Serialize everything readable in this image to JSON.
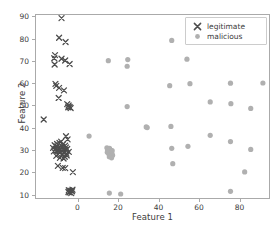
{
  "chart_data": {
    "type": "scatter",
    "title": "",
    "xlabel": "Feature 1",
    "ylabel": "Feature 2",
    "xlim": [
      -21,
      95
    ],
    "ylim": [
      8,
      91
    ],
    "xticks": [
      0,
      20,
      40,
      60,
      80
    ],
    "yticks": [
      10,
      20,
      30,
      40,
      50,
      60,
      70,
      80,
      90
    ],
    "grid": false,
    "legend_position": "upper right",
    "series": [
      {
        "name": "legitimate",
        "marker": "x",
        "color": "#4d4d4d",
        "points": [
          [
            -8.4,
            89.6
          ],
          [
            -9.6,
            80.8
          ],
          [
            -6.4,
            78.9
          ],
          [
            -11.6,
            73.0
          ],
          [
            -12.0,
            71.6
          ],
          [
            -8.4,
            71.4
          ],
          [
            -6.6,
            70.6
          ],
          [
            -11.8,
            68.8
          ],
          [
            -4.4,
            69.0
          ],
          [
            -11.4,
            60.1
          ],
          [
            -11.0,
            59.2
          ],
          [
            -9.6,
            58.3
          ],
          [
            -7.2,
            57.2
          ],
          [
            -9.8,
            53.8
          ],
          [
            -5.6,
            51.0
          ],
          [
            -4.9,
            50.4
          ],
          [
            -4.4,
            49.7
          ],
          [
            -3.9,
            49.3
          ],
          [
            -5.1,
            49.6
          ],
          [
            -17.2,
            44.1
          ],
          [
            -6.2,
            36.6
          ],
          [
            -5.4,
            35.2
          ],
          [
            -8.6,
            34.2
          ],
          [
            -9.4,
            33.6
          ],
          [
            -10.6,
            33.1
          ],
          [
            -11.8,
            32.6
          ],
          [
            -7.8,
            32.9
          ],
          [
            -6.6,
            32.4
          ],
          [
            -12.6,
            31.4
          ],
          [
            -11.2,
            31.0
          ],
          [
            -9.8,
            31.2
          ],
          [
            -8.8,
            30.6
          ],
          [
            -7.6,
            30.8
          ],
          [
            -6.4,
            30.4
          ],
          [
            -5.6,
            30.9
          ],
          [
            -10.4,
            30.1
          ],
          [
            -12.2,
            29.8
          ],
          [
            -9.0,
            29.4
          ],
          [
            -7.2,
            29.2
          ],
          [
            -6.0,
            28.8
          ],
          [
            -4.8,
            29.6
          ],
          [
            -10.0,
            28.6
          ],
          [
            -8.2,
            28.2
          ],
          [
            -11.0,
            27.8
          ],
          [
            -6.8,
            27.4
          ],
          [
            -9.2,
            26.9
          ],
          [
            -7.4,
            26.6
          ],
          [
            -5.8,
            28.0
          ],
          [
            -8.0,
            31.8
          ],
          [
            -10.8,
            32.0
          ],
          [
            -6.2,
            31.6
          ],
          [
            -9.6,
            30.2
          ],
          [
            -10.2,
            23.3
          ],
          [
            -7.8,
            22.4
          ],
          [
            -6.6,
            22.3
          ],
          [
            -2.8,
            20.5
          ],
          [
            -4.8,
            12.4
          ],
          [
            -4.0,
            12.2
          ],
          [
            -3.2,
            11.9
          ],
          [
            -4.4,
            11.4
          ],
          [
            -3.6,
            11.1
          ],
          [
            -5.0,
            11.6
          ],
          [
            -3.0,
            12.6
          ]
        ]
      },
      {
        "name": "malicious",
        "marker": "o",
        "color": "#b0b0b0",
        "points": [
          [
            46.0,
            79.6
          ],
          [
            53.5,
            71.2
          ],
          [
            24.3,
            71.0
          ],
          [
            14.7,
            70.5
          ],
          [
            24.0,
            68.0
          ],
          [
            91.0,
            60.5
          ],
          [
            55.0,
            60.2
          ],
          [
            75.0,
            60.4
          ],
          [
            45.0,
            59.3
          ],
          [
            65.0,
            52.0
          ],
          [
            75.2,
            51.2
          ],
          [
            85.0,
            49.1
          ],
          [
            24.0,
            49.9
          ],
          [
            45.6,
            41.0
          ],
          [
            33.4,
            40.8
          ],
          [
            33.9,
            40.5
          ],
          [
            65.0,
            37.0
          ],
          [
            5.2,
            36.7
          ],
          [
            75.0,
            34.2
          ],
          [
            54.0,
            32.1
          ],
          [
            46.0,
            31.2
          ],
          [
            85.0,
            30.7
          ],
          [
            14.0,
            31.4
          ],
          [
            14.6,
            30.9
          ],
          [
            15.3,
            31.2
          ],
          [
            15.9,
            30.4
          ],
          [
            14.3,
            30.1
          ],
          [
            15.1,
            29.6
          ],
          [
            15.7,
            29.9
          ],
          [
            16.4,
            29.3
          ],
          [
            14.9,
            28.8
          ],
          [
            15.5,
            28.4
          ],
          [
            16.1,
            28.9
          ],
          [
            16.8,
            28.1
          ],
          [
            15.2,
            27.4
          ],
          [
            16.3,
            26.9
          ],
          [
            14.2,
            29.4
          ],
          [
            16.6,
            30.2
          ],
          [
            46.5,
            24.3
          ],
          [
            82.0,
            20.6
          ],
          [
            15.2,
            11.1
          ],
          [
            20.8,
            10.7
          ],
          [
            75.0,
            11.9
          ]
        ]
      }
    ]
  },
  "legend": {
    "items": [
      {
        "label": "legitimate",
        "marker": "x"
      },
      {
        "label": "malicious",
        "marker": "o"
      }
    ]
  },
  "axis": {
    "x_label": "Feature 1",
    "y_label": "Feature 2",
    "x_tick_labels": [
      "0",
      "20",
      "40",
      "60",
      "80"
    ],
    "y_tick_labels": [
      "10",
      "20",
      "30",
      "40",
      "50",
      "60",
      "70",
      "80",
      "90"
    ]
  },
  "colors": {
    "legitimate": "#4d4d4d",
    "malicious": "#b0b0b0",
    "frame": "#aaaaaa",
    "text": "#3b3b3b",
    "background": "#ffffff"
  }
}
